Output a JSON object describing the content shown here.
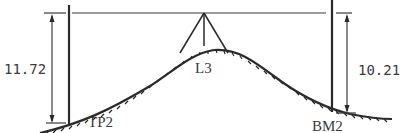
{
  "diagram": {
    "type": "differential-leveling-sketch",
    "colors": {
      "ink": "#2a2a2a",
      "background": "#ffffff"
    },
    "line_of_sight": {
      "label": ""
    },
    "instrument": {
      "label": "L3"
    },
    "backsight": {
      "station": "TP2",
      "reading": "11.72"
    },
    "foresight": {
      "station": "BM2",
      "reading": "10.21"
    }
  }
}
